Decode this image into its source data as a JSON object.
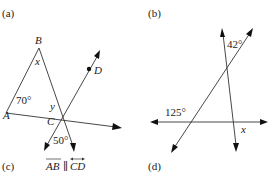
{
  "panels": {
    "a": {
      "label": "(a)"
    },
    "b": {
      "label": "(b)"
    },
    "c": {
      "label": "(c)",
      "condition": "AB ∥ CD",
      "cond_ab": "AB",
      "cond_par": "∥",
      "cond_cd": "CD"
    },
    "d": {
      "label": "(d)"
    }
  },
  "left_figure": {
    "points": {
      "A": "A",
      "B": "B",
      "C": "C",
      "D": "D"
    },
    "angles": {
      "at_A": "70°",
      "at_B": "x",
      "at_C_upper": "y",
      "at_C_lower": "50°"
    }
  },
  "right_figure": {
    "angles": {
      "top": "42°",
      "left": "125°",
      "bottom_right": "x"
    }
  }
}
